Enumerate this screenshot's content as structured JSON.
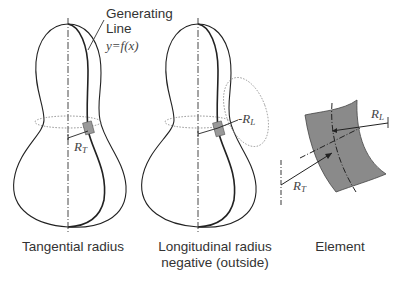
{
  "figure": {
    "annotation": {
      "generating_line_1": "Generating",
      "generating_line_2": "Line",
      "equation": "y=f(x)"
    },
    "labels": {
      "rt_main": "R",
      "rt_sub": "T",
      "rl_main": "R",
      "rl_sub": "L",
      "rl_prefix": "-"
    },
    "panels": [
      {
        "id": "tangential",
        "caption_line1": "Tangential radius",
        "caption_line2": ""
      },
      {
        "id": "longitudinal",
        "caption_line1": "Longitudinal radius",
        "caption_line2": "negative (outside)"
      },
      {
        "id": "element",
        "caption_line1": "Element",
        "caption_line2": ""
      }
    ],
    "colors": {
      "line": "#222222",
      "element_fill": "#8a8a8a",
      "patch_fill": "#999999",
      "dotted": "#777777",
      "text": "#333333"
    }
  }
}
